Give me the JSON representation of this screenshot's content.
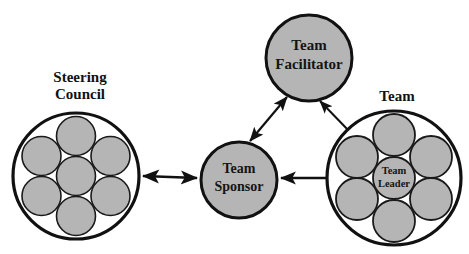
{
  "canvas": {
    "width": 469,
    "height": 254,
    "background": "#ffffff"
  },
  "palette": {
    "fill_gray": "#b5b5b5",
    "stroke_black": "#111111",
    "ring_fill": "#ffffff",
    "text_color": "#141414"
  },
  "groups": {
    "steering_council": {
      "label_line1": "Steering",
      "label_line2": "Council",
      "center": {
        "x": 76,
        "y": 176
      },
      "radius": 64,
      "member_radius": 19,
      "member_count": 7
    },
    "team": {
      "label": "Team",
      "center": {
        "x": 394,
        "y": 178
      },
      "radius": 68,
      "member_radius": 21,
      "member_count": 7,
      "leader_label_line1": "Team",
      "leader_label_line2": "Leader"
    }
  },
  "nodes": {
    "team_facilitator": {
      "label_line1": "Team",
      "label_line2": "Facilitator",
      "center": {
        "x": 309,
        "y": 58
      },
      "radius": 44
    },
    "team_sponsor": {
      "label_line1": "Team",
      "label_line2": "Sponsor",
      "center": {
        "x": 239,
        "y": 180
      },
      "radius": 39
    }
  },
  "connectors": [
    {
      "id": "council-sponsor",
      "from": "steering-council",
      "to": "team-sponsor",
      "style": "double-headed",
      "orientation": "horizontal"
    },
    {
      "id": "sponsor-facilitator",
      "from": "team-sponsor",
      "to": "team-facilitator",
      "style": "double-headed",
      "orientation": "diagonal"
    },
    {
      "id": "leader-sponsor",
      "from": "team-leader",
      "to": "team-sponsor",
      "style": "double-headed",
      "orientation": "horizontal"
    },
    {
      "id": "leader-facilitator",
      "from": "team-leader",
      "to": "team-facilitator",
      "style": "double-headed",
      "orientation": "diagonal"
    }
  ]
}
